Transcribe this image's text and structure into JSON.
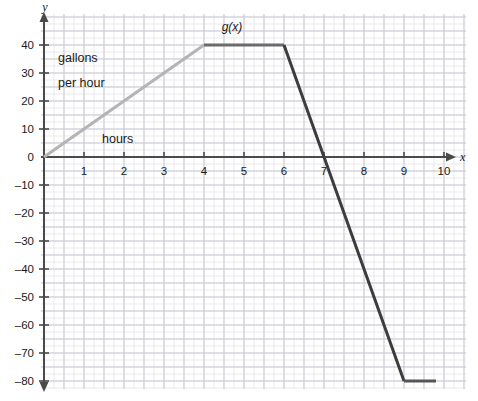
{
  "chart_data": {
    "type": "line",
    "title": "",
    "xlabel": "hours",
    "ylabel": "gallons per hour",
    "x_axis_name": "x",
    "y_axis_name": "y",
    "curve_label": "g(x)",
    "xlim": [
      -0.1,
      10.6
    ],
    "ylim": [
      -84,
      46
    ],
    "x_ticks": [
      1,
      2,
      3,
      4,
      5,
      6,
      7,
      8,
      9,
      10
    ],
    "x_tick_labels": [
      "1",
      "2",
      "3",
      "4",
      "5",
      "6",
      "7",
      "8",
      "9",
      "10"
    ],
    "y_ticks": [
      40,
      30,
      20,
      10,
      0,
      -10,
      -20,
      -30,
      -40,
      -50,
      -60,
      -70,
      -80
    ],
    "y_tick_labels": [
      "40",
      "30",
      "20",
      "10",
      "0",
      "–10",
      "–20",
      "–30",
      "–40",
      "–50",
      "–60",
      "–70",
      "–80"
    ],
    "grid": true,
    "grid_minor_step_x": 0.25,
    "grid_minor_step_y": 2.5,
    "grid_major_step_x": 0.5,
    "grid_major_step_y": 5,
    "legend": "none",
    "segments": [
      {
        "name": "rising-ramp",
        "color": "#b4b4b4",
        "points": [
          [
            0,
            0
          ],
          [
            4,
            40
          ]
        ]
      },
      {
        "name": "plateau-high",
        "color": "#6b6b6b",
        "points": [
          [
            4,
            40
          ],
          [
            6,
            40
          ]
        ]
      },
      {
        "name": "falling-ramp",
        "color": "#3c3c3c",
        "points": [
          [
            6,
            40
          ],
          [
            9,
            -80
          ]
        ]
      },
      {
        "name": "plateau-low",
        "color": "#555555",
        "points": [
          [
            9,
            -80
          ],
          [
            9.8,
            -80
          ]
        ]
      }
    ],
    "points": [
      [
        0,
        0
      ],
      [
        4,
        40
      ],
      [
        6,
        40
      ],
      [
        9,
        -80
      ],
      [
        9.8,
        -80
      ]
    ],
    "x_intercept": 7,
    "annotations": [
      {
        "text": "gallons",
        "x": 0.35,
        "y": 34
      },
      {
        "text": "per hour",
        "x": 0.35,
        "y": 25
      },
      {
        "text": "hours",
        "x": 1.45,
        "y": 5
      },
      {
        "text": "g(x)",
        "x": 4.7,
        "y": 45
      }
    ]
  },
  "colors": {
    "grid_minor": "#e9e9ef",
    "grid_major": "#c9c9d4",
    "axis": "#4a4a4a",
    "text": "#1a1a1a",
    "ramp_light": "#b4b4b4",
    "plateau": "#6b6b6b",
    "ramp_dark": "#3c3c3c",
    "background": "#ffffff"
  }
}
